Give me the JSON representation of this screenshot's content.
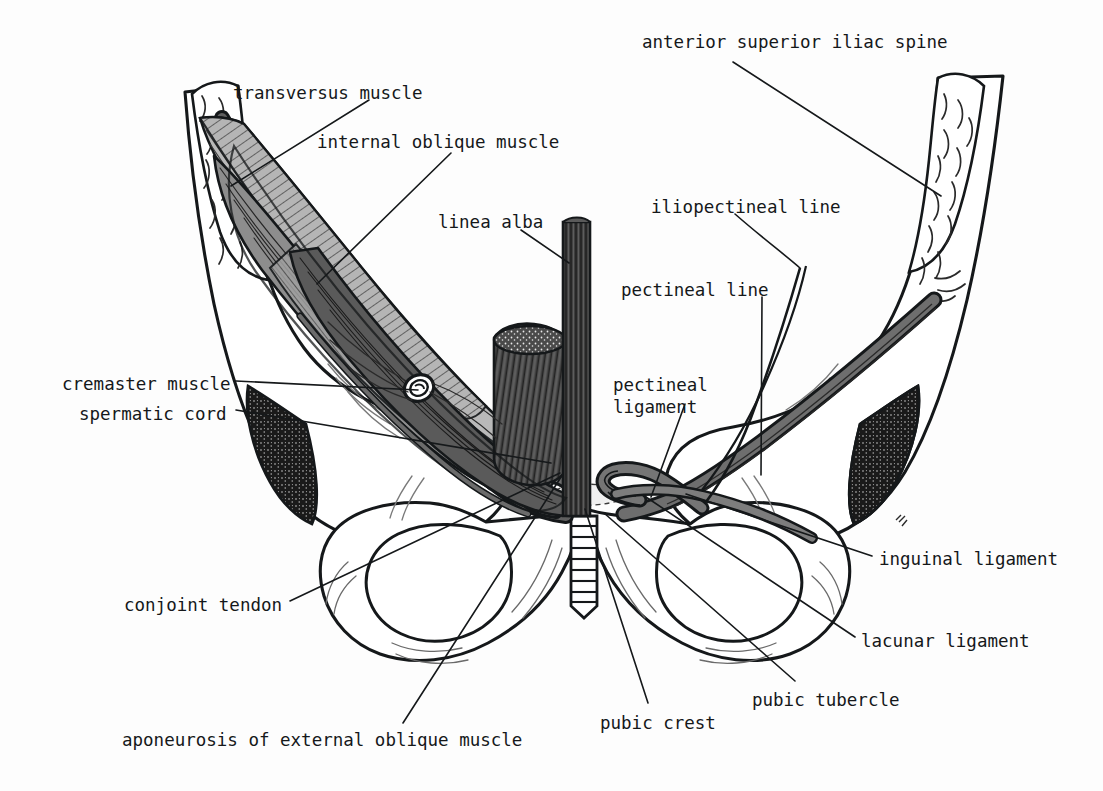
{
  "figure": {
    "background_color": "#fdfdfd",
    "ink_color": "#15181a",
    "palette": {
      "ink": "#15181a",
      "paper": "#fdfdfd",
      "bone_fill": "#ffffff",
      "muscle_light": "#b9b9b9",
      "muscle_mid": "#8d8d8d",
      "muscle_dark": "#5a5a5a",
      "muscle_darkest": "#3a3a3a",
      "shadow_black": "#1a1a1a"
    }
  },
  "labels": [
    {
      "id": "anterior-superior-iliac-spine",
      "text": "anterior superior iliac spine",
      "x": 642,
      "y": 32
    },
    {
      "id": "transversus-muscle",
      "text": "transversus muscle",
      "x": 233,
      "y": 83
    },
    {
      "id": "internal-oblique-muscle",
      "text": "internal oblique muscle",
      "x": 317,
      "y": 132
    },
    {
      "id": "iliopectineal-line",
      "text": "iliopectineal line",
      "x": 651,
      "y": 197
    },
    {
      "id": "linea-alba",
      "text": "linea alba",
      "x": 438,
      "y": 212
    },
    {
      "id": "pectineal-line",
      "text": "pectineal line",
      "x": 621,
      "y": 280
    },
    {
      "id": "cremaster-muscle",
      "text": "cremaster muscle",
      "x": 62,
      "y": 374
    },
    {
      "id": "pectineal-ligament",
      "text": "pectineal\nligament",
      "x": 613,
      "y": 374
    },
    {
      "id": "spermatic-cord",
      "text": "spermatic cord",
      "x": 79,
      "y": 404
    },
    {
      "id": "inguinal-ligament",
      "text": "inguinal ligament",
      "x": 879,
      "y": 549
    },
    {
      "id": "conjoint-tendon",
      "text": "conjoint tendon",
      "x": 124,
      "y": 595
    },
    {
      "id": "lacunar-ligament",
      "text": "lacunar ligament",
      "x": 861,
      "y": 631
    },
    {
      "id": "pubic-tubercle",
      "text": "pubic tubercle",
      "x": 752,
      "y": 690
    },
    {
      "id": "pubic-crest",
      "text": "pubic crest",
      "x": 600,
      "y": 713
    },
    {
      "id": "aponeurosis-of-external-oblique-muscle",
      "text": "aponeurosis of external oblique muscle",
      "x": 122,
      "y": 730
    }
  ],
  "leader_lines": [
    {
      "id": "leader-anterior-superior-iliac-spine",
      "points": "733,62 941,196"
    },
    {
      "id": "leader-transversus-muscle",
      "points": "369,100 231,186"
    },
    {
      "id": "leader-internal-oblique-muscle",
      "points": "451,153 317,284"
    },
    {
      "id": "leader-iliopectineal-line",
      "points": "735,214 800,268"
    },
    {
      "id": "leader-linea-alba",
      "points": "521,230 569,263"
    },
    {
      "id": "leader-pectineal-line",
      "points": "762,297 761,475"
    },
    {
      "id": "leader-cremaster-muscle",
      "points": "236,381 418,390"
    },
    {
      "id": "leader-pectineal-ligament",
      "points": "685,404 651,497"
    },
    {
      "id": "leader-spermatic-cord",
      "points": "236,410 551,463"
    },
    {
      "id": "leader-inguinal-ligament",
      "points": "872,556 686,494"
    },
    {
      "id": "leader-conjoint-tendon",
      "points": "290,601 560,473"
    },
    {
      "id": "leader-lacunar-ligament",
      "points": "855,637 646,497"
    },
    {
      "id": "leader-pubic-tubercle",
      "points": "795,681 604,513"
    },
    {
      "id": "leader-pubic-crest",
      "points": "648,703 585,509"
    },
    {
      "id": "leader-aponeurosis-of-external-oblique-muscle",
      "points": "403,723 563,474"
    }
  ],
  "structures": [
    {
      "id": "left-iliac-crest",
      "name": "left iliac crest (cut)",
      "side": "left"
    },
    {
      "id": "right-iliac-crest",
      "name": "right iliac crest with anterior superior iliac spine",
      "side": "right"
    },
    {
      "id": "transversus-abdominis",
      "name": "transversus abdominis muscle",
      "side": "left"
    },
    {
      "id": "internal-oblique",
      "name": "internal oblique muscle",
      "side": "left"
    },
    {
      "id": "linea-alba-band",
      "name": "linea alba",
      "side": "midline"
    },
    {
      "id": "rectus-abdominis-stump",
      "name": "rectus abdominis cut stump",
      "side": "left"
    },
    {
      "id": "inguinal-ligament-left",
      "name": "inguinal ligament",
      "side": "left"
    },
    {
      "id": "inguinal-ligament-right",
      "name": "inguinal ligament",
      "side": "right"
    },
    {
      "id": "spermatic-cord-ring",
      "name": "spermatic cord in deep inguinal ring",
      "side": "left"
    },
    {
      "id": "pubic-symphysis",
      "name": "pubic symphysis",
      "side": "midline"
    },
    {
      "id": "obturator-foramen-left",
      "name": "left obturator foramen",
      "side": "left"
    },
    {
      "id": "obturator-foramen-right",
      "name": "right obturator foramen",
      "side": "right"
    },
    {
      "id": "greater-sciatic-notch-left",
      "name": "left sciatic notch shadow",
      "side": "left"
    },
    {
      "id": "greater-sciatic-notch-right",
      "name": "right sciatic notch shadow",
      "side": "right"
    },
    {
      "id": "lacunar-ligament-struct",
      "name": "lacunar ligament",
      "side": "right"
    },
    {
      "id": "pectineal-ligament-struct",
      "name": "pectineal ligament",
      "side": "right"
    }
  ]
}
